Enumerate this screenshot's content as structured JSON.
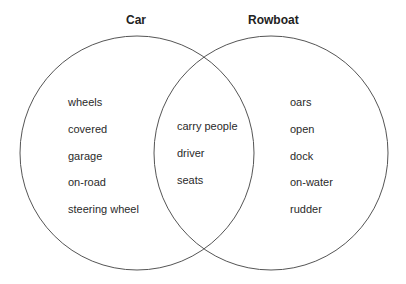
{
  "diagram": {
    "type": "venn",
    "sets": [
      {
        "name": "Car",
        "only_items": [
          "wheels",
          "covered",
          "garage",
          "on-road",
          "steering wheel"
        ]
      },
      {
        "name": "Rowboat",
        "only_items": [
          "oars",
          "open",
          "dock",
          "on-water",
          "rudder"
        ]
      }
    ],
    "intersection_items": [
      "carry people",
      "driver",
      "seats"
    ],
    "colors": {
      "stroke": "#555555",
      "text": "#2a2a2a",
      "background": "#ffffff"
    }
  }
}
